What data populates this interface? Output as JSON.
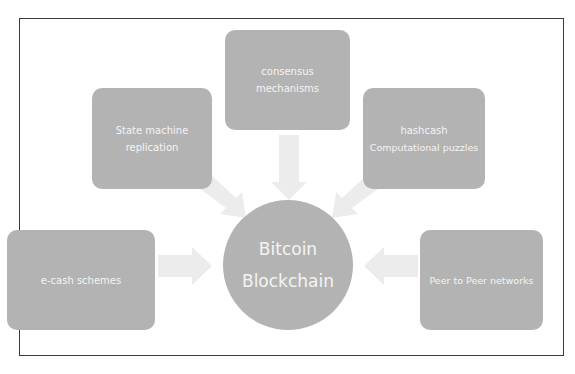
{
  "diagram": {
    "center": {
      "line1": "Bitcoin",
      "line2": "Blockchain"
    },
    "nodes": [
      {
        "id": "consensus",
        "line1": "consensus",
        "line2": "mechanisms"
      },
      {
        "id": "state-machine",
        "line1": "State machine",
        "line2": "replication"
      },
      {
        "id": "hashcash",
        "line1": "hashcash",
        "line2": "Computational puzzles"
      },
      {
        "id": "ecash",
        "line1": "e-cash schemes"
      },
      {
        "id": "p2p",
        "line1": "Peer to Peer networks"
      }
    ],
    "colors": {
      "node_fill": "#b3b3b3",
      "node_text": "#f4f4f4",
      "arrow_fill": "#ececec",
      "frame": "#3a3a3a"
    }
  }
}
